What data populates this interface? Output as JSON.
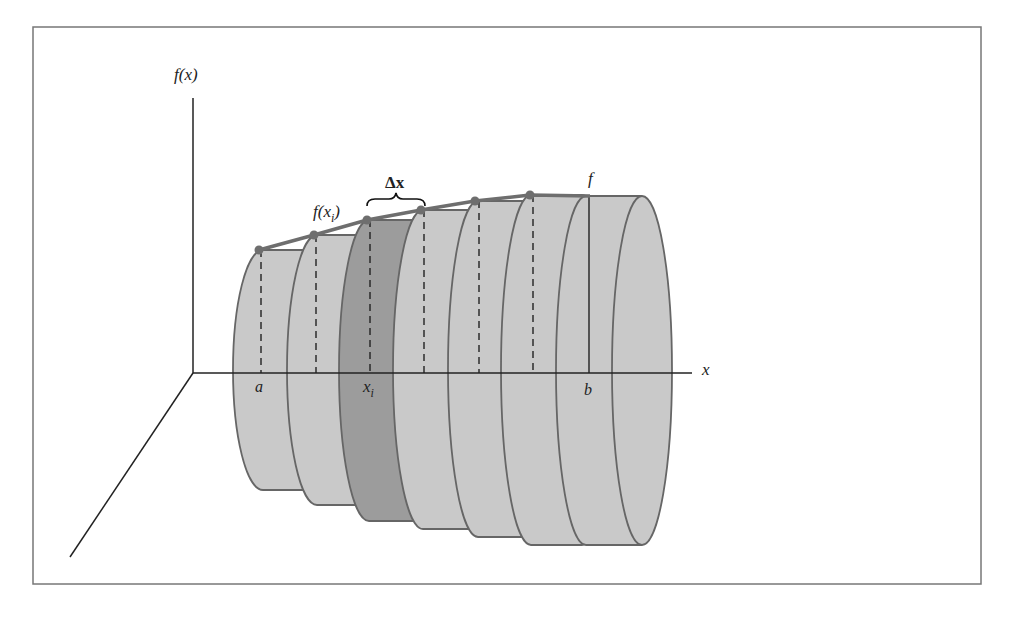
{
  "figure": {
    "labels": {
      "y_axis": "f(x)",
      "x_axis": "x",
      "a": "a",
      "b": "b",
      "xi": "x",
      "xi_sub": "i",
      "fxi_pre": "f(x",
      "fxi_sub": "i",
      "fxi_post": ")",
      "delta_x": "Δx",
      "f": "f"
    },
    "colors": {
      "disk_fill": "#c9c9c9",
      "highlight_disk_fill": "#9c9c9c",
      "outline": "#666666",
      "curve": "#6e6e6e",
      "axis": "#222222",
      "frame": "#777777"
    },
    "disks": [
      {
        "left": 233,
        "right": 287,
        "top": 250,
        "bottom": 490,
        "sample_x": 261,
        "highlight": false
      },
      {
        "left": 287,
        "right": 339,
        "top": 235,
        "bottom": 505,
        "sample_x": 316,
        "highlight": false
      },
      {
        "left": 339,
        "right": 393,
        "top": 220,
        "bottom": 521,
        "sample_x": 370,
        "highlight": true
      },
      {
        "left": 393,
        "right": 448,
        "top": 210,
        "bottom": 529,
        "sample_x": 424,
        "highlight": false
      },
      {
        "left": 448,
        "right": 501,
        "top": 201,
        "bottom": 537,
        "sample_x": 479,
        "highlight": false
      },
      {
        "left": 501,
        "right": 556,
        "top": 195,
        "bottom": 545,
        "sample_x": 533,
        "highlight": false
      },
      {
        "left": 556,
        "right": 616,
        "top": 196,
        "bottom": 545,
        "sample_x": 589,
        "highlight": false
      }
    ],
    "curve_points": [
      [
        259,
        250
      ],
      [
        314,
        235
      ],
      [
        367,
        220
      ],
      [
        421,
        210
      ],
      [
        475,
        201
      ],
      [
        530,
        195
      ],
      [
        590,
        196
      ]
    ]
  }
}
